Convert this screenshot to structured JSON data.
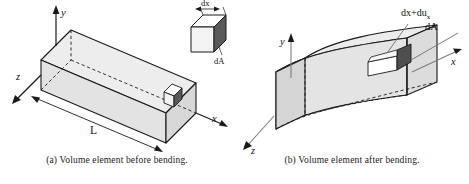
{
  "figure": {
    "colors": {
      "face_light": "#e9e9e9",
      "face_mid": "#d6d6d6",
      "face_dark": "#5a5a5a",
      "face_white": "#ffffff",
      "outline": "#1a1a1a",
      "leader": "#6e6e6e",
      "background": "#ffffff"
    }
  },
  "panel_a": {
    "caption": "(a)  Volume element before bending.",
    "axes": {
      "y_label": "y",
      "x_label": "x",
      "z_label": "z"
    },
    "dimension_label": "L",
    "inset": {
      "top_label": "dx",
      "face_label": "dA"
    }
  },
  "panel_b": {
    "caption": "(b)  Volume element after bending.",
    "axes": {
      "y_label": "y",
      "x_label": "x",
      "z_label": "z"
    },
    "annotations": {
      "element_label": "dx+du",
      "element_sub": "x",
      "area_label": "dA"
    }
  }
}
